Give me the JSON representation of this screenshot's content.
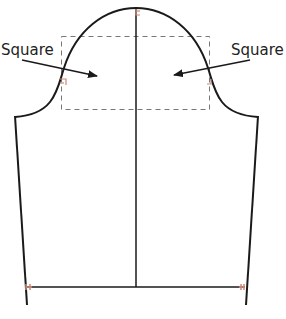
{
  "diagram": {
    "labels": {
      "left": "Square",
      "right": "Square"
    },
    "caption": "",
    "colors": {
      "outline": "#1a1a1a",
      "dashed_box": "#777777",
      "square_marker": "#c98a7a",
      "background": "#ffffff"
    }
  }
}
